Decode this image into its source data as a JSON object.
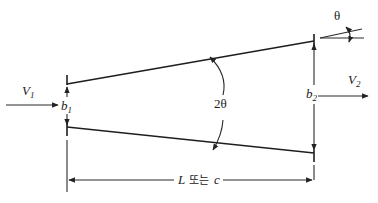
{
  "diagram": {
    "type": "diffuser-geometry",
    "labels": {
      "v1": "V",
      "v1_sub": "1",
      "v2": "V",
      "v2_sub": "2",
      "b1": "b",
      "b1_sub": "1",
      "b2": "b",
      "b2_sub": "2",
      "two_theta": "2θ",
      "theta": "θ",
      "length_L": "L",
      "length_or": "또는",
      "length_c": "c"
    },
    "colors": {
      "line": "#2a2a2a",
      "background": "#ffffff"
    }
  }
}
